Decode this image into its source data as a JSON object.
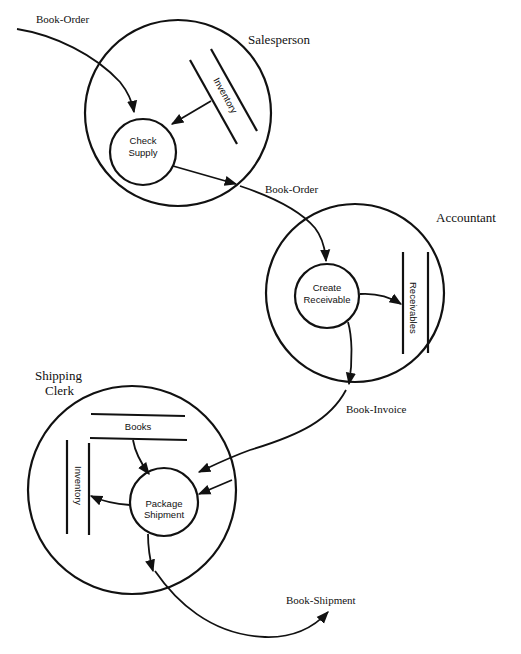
{
  "diagram": {
    "type": "data-flow-diagram",
    "colors": {
      "ink": "#111111",
      "background": "#ffffff"
    },
    "agents": [
      {
        "id": "salesperson",
        "label": "Salesperson"
      },
      {
        "id": "accountant",
        "label": "Accountant"
      },
      {
        "id": "shipping_clerk",
        "label_line1": "Shipping",
        "label_line2": "Clerk"
      }
    ],
    "processes": [
      {
        "id": "check_supply",
        "line1": "Check",
        "line2": "Supply",
        "agent": "salesperson"
      },
      {
        "id": "create_receivable",
        "line1": "Create",
        "line2": "Receivable",
        "agent": "accountant"
      },
      {
        "id": "package_shipment",
        "line1": "Package",
        "line2": "Shipment",
        "agent": "shipping_clerk"
      }
    ],
    "stores": [
      {
        "id": "inventory_sales",
        "label": "Inventory",
        "agent": "salesperson"
      },
      {
        "id": "receivables",
        "label": "Receivables",
        "agent": "accountant"
      },
      {
        "id": "books",
        "label": "Books",
        "agent": "shipping_clerk"
      },
      {
        "id": "inventory_shipping",
        "label": "Inventory",
        "agent": "shipping_clerk"
      }
    ],
    "flows": [
      {
        "id": "flow_in_book_order",
        "label": "Book-Order",
        "from": "external",
        "to": "check_supply"
      },
      {
        "id": "flow_inventory_to_check",
        "label": "",
        "from": "inventory_sales",
        "to": "check_supply"
      },
      {
        "id": "flow_book_order_2",
        "label": "Book-Order",
        "from": "check_supply",
        "to": "create_receivable"
      },
      {
        "id": "flow_to_receivables",
        "label": "",
        "from": "create_receivable",
        "to": "receivables"
      },
      {
        "id": "flow_book_invoice",
        "label": "Book-Invoice",
        "from": "create_receivable",
        "to": "package_shipment"
      },
      {
        "id": "flow_books_to_package",
        "label": "",
        "from": "books",
        "to": "package_shipment"
      },
      {
        "id": "flow_package_to_inventory",
        "label": "",
        "from": "package_shipment",
        "to": "inventory_shipping"
      },
      {
        "id": "flow_book_shipment",
        "label": "Book-Shipment",
        "from": "package_shipment",
        "to": "external"
      }
    ]
  }
}
